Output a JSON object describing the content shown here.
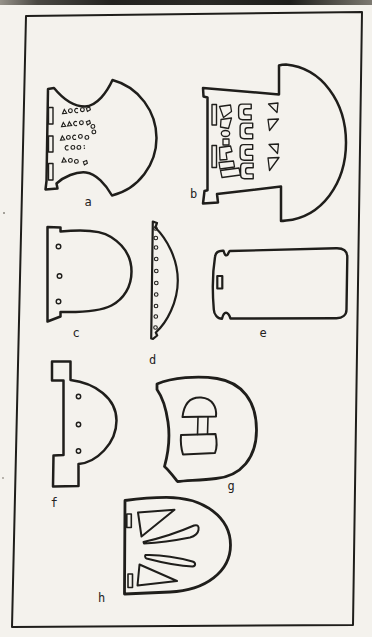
{
  "page": {
    "paper_color": "#f4f2ed",
    "ink_color": "#1f1e1b",
    "description": "plate of artifact line drawings"
  },
  "figure": {
    "items": [
      {
        "id": "a",
        "label": "a"
      },
      {
        "id": "b",
        "label": "b"
      },
      {
        "id": "c",
        "label": "c"
      },
      {
        "id": "d",
        "label": "d"
      },
      {
        "id": "e",
        "label": "e"
      },
      {
        "id": "f",
        "label": "f"
      },
      {
        "id": "g",
        "label": "g"
      },
      {
        "id": "h",
        "label": "h"
      }
    ]
  }
}
